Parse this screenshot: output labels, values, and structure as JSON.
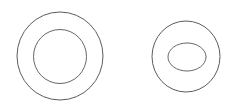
{
  "canvas": {
    "width": 235,
    "height": 112,
    "background_color": "#ffffff",
    "title": "Two annulus outlines"
  },
  "style": {
    "stroke_color": "#4a4a4a",
    "stroke_color_secondary": "#555555",
    "stroke_width": 0.9,
    "fill": "none"
  },
  "shapes": [
    {
      "id": "left-annulus",
      "label": "Circular annulus",
      "kind": "annulus",
      "outer": {
        "kind": "circle",
        "label": "Outer circle",
        "cx": 60,
        "cy": 56,
        "rx": 43,
        "ry": 44
      },
      "inner": {
        "kind": "circle",
        "label": "Inner circle",
        "cx": 60,
        "cy": 56.5,
        "rx": 26.5,
        "ry": 27
      }
    },
    {
      "id": "right-annulus",
      "label": "Elliptical annulus",
      "kind": "annulus",
      "outer": {
        "kind": "ellipse",
        "label": "Outer ellipse",
        "cx": 186,
        "cy": 56.5,
        "rx": 34,
        "ry": 35.5
      },
      "inner": {
        "kind": "ellipse",
        "label": "Inner ellipse",
        "cx": 187,
        "cy": 57,
        "rx": 19,
        "ry": 14
      }
    }
  ]
}
